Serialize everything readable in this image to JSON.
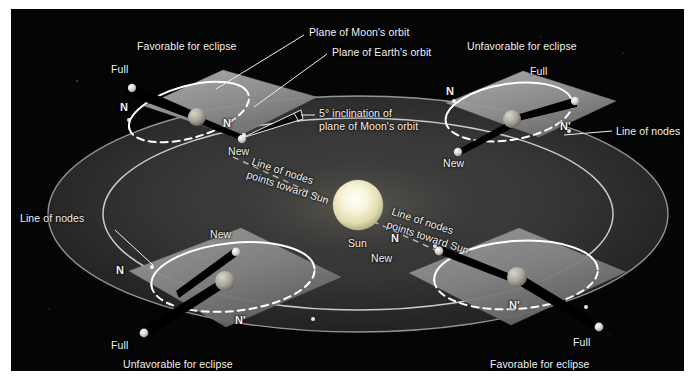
{
  "figure": {
    "background_color": "#ffffff",
    "panel_color": "#050505",
    "ecliptic_disk_color": "#2e2e2e",
    "moon_plane_color": "#9a9a9a",
    "orbit_line_color": "#ffffff",
    "text_color": "#f2f2f2",
    "sun_color": "#f5f0cf"
  },
  "callouts": {
    "plane_of_moons_orbit": "Plane of Moon's orbit",
    "plane_of_earths_orbit": "Plane of Earth's orbit",
    "inclination_line1": "5° inclination of",
    "inclination_line2": "plane of Moon's orbit",
    "line_of_nodes_left": "Line of nodes",
    "line_of_nodes_right": "Line of nodes",
    "sun": "Sun"
  },
  "nodes_toward_sun": {
    "upper_left_line1": "Line of nodes",
    "upper_left_line2": "points toward Sun",
    "lower_right_line1": "Line of nodes",
    "lower_right_line2": "points toward Sun"
  },
  "systems": [
    {
      "id": "top-left",
      "caption": "Favorable for eclipse",
      "node_near": "N",
      "node_far": "N'",
      "phase_upper": "Full",
      "phase_lower": "New"
    },
    {
      "id": "top-right",
      "caption": "Unfavorable for eclipse",
      "node_near": "N",
      "node_far": "N'",
      "phase_upper": "Full",
      "phase_lower": "New"
    },
    {
      "id": "bottom-left",
      "caption": "Unfavorable for eclipse",
      "node_near": "N",
      "node_far": "N'",
      "phase_upper": "New",
      "phase_lower": "Full"
    },
    {
      "id": "bottom-right",
      "caption": "Favorable for eclipse",
      "node_near": "N",
      "node_far": "N'",
      "phase_upper": "New",
      "phase_lower": "Full"
    }
  ]
}
